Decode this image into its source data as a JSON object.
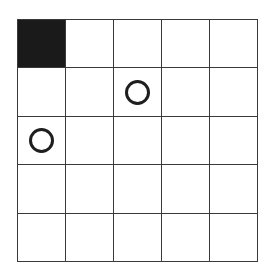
{
  "board": {
    "rows": 5,
    "cols": 5,
    "cells": [
      [
        "filled",
        "empty",
        "empty",
        "empty",
        "empty"
      ],
      [
        "empty",
        "empty",
        "circle",
        "empty",
        "empty"
      ],
      [
        "circle",
        "empty",
        "empty",
        "empty",
        "empty"
      ],
      [
        "empty",
        "empty",
        "empty",
        "empty",
        "empty"
      ],
      [
        "empty",
        "empty",
        "empty",
        "empty",
        "empty"
      ]
    ],
    "colors": {
      "filled": "#1a1a1a",
      "grid_line": "#3a3a3a",
      "circle": "#1e1e1e",
      "background": "#ffffff"
    }
  }
}
